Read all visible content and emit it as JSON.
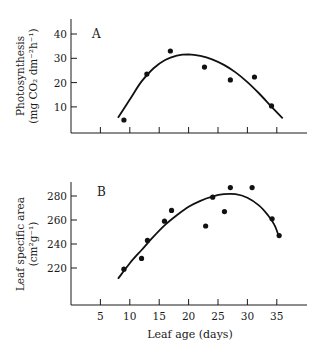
{
  "chart_data": [
    {
      "panel": "A",
      "type": "scatter",
      "title": "",
      "panel_label": "A",
      "xlabel": "",
      "ylabel": "Photosynthesis",
      "ylabel_units": "(mg CO₂ dm⁻²h⁻¹)",
      "xlim": [
        0,
        40
      ],
      "ylim": [
        0,
        45
      ],
      "x_ticks": [
        5,
        10,
        15,
        20,
        25,
        30,
        35
      ],
      "x_tick_labels_shown": false,
      "y_ticks": [
        10,
        20,
        30,
        40
      ],
      "y_tick_labels": [
        "10",
        "20",
        "30",
        "40"
      ],
      "grid": false,
      "points": [
        {
          "x": 9,
          "y": 4.6
        },
        {
          "x": 12.9,
          "y": 23.5
        },
        {
          "x": 16.9,
          "y": 33
        },
        {
          "x": 22.7,
          "y": 26.4
        },
        {
          "x": 27.1,
          "y": 21.1
        },
        {
          "x": 31.2,
          "y": 22.3
        },
        {
          "x": 34.1,
          "y": 10.4
        }
      ],
      "fitted_curve": [
        {
          "x": 8,
          "y": 5.5
        },
        {
          "x": 10,
          "y": 13
        },
        {
          "x": 12,
          "y": 20.5
        },
        {
          "x": 14,
          "y": 25.8
        },
        {
          "x": 16,
          "y": 29.3
        },
        {
          "x": 18,
          "y": 31.1
        },
        {
          "x": 20,
          "y": 31.6
        },
        {
          "x": 22,
          "y": 31.0
        },
        {
          "x": 24,
          "y": 29.6
        },
        {
          "x": 26,
          "y": 27.3
        },
        {
          "x": 28,
          "y": 24.2
        },
        {
          "x": 30,
          "y": 20.2
        },
        {
          "x": 32,
          "y": 15.5
        },
        {
          "x": 34,
          "y": 10.3
        },
        {
          "x": 36,
          "y": 5.3
        }
      ]
    },
    {
      "panel": "B",
      "type": "scatter",
      "title": "",
      "panel_label": "B",
      "xlabel": "Leaf age (days)",
      "ylabel": "Leaf specific area",
      "ylabel_units": "(cm²g⁻¹)",
      "xlim": [
        0,
        40
      ],
      "ylim": [
        170,
        292
      ],
      "x_ticks": [
        5,
        10,
        15,
        20,
        25,
        30,
        35
      ],
      "x_tick_labels": [
        "5",
        "10",
        "15",
        "20",
        "25",
        "30",
        "35"
      ],
      "y_ticks": [
        220,
        240,
        260,
        280
      ],
      "y_tick_labels": [
        "220",
        "240",
        "260",
        "280"
      ],
      "grid": false,
      "points": [
        {
          "x": 9,
          "y": 219
        },
        {
          "x": 12,
          "y": 228
        },
        {
          "x": 13,
          "y": 243
        },
        {
          "x": 15.9,
          "y": 259
        },
        {
          "x": 17.1,
          "y": 268
        },
        {
          "x": 22.9,
          "y": 255
        },
        {
          "x": 24.1,
          "y": 279
        },
        {
          "x": 26.1,
          "y": 267
        },
        {
          "x": 27.1,
          "y": 287
        },
        {
          "x": 30.8,
          "y": 287
        },
        {
          "x": 34.2,
          "y": 261
        },
        {
          "x": 35.4,
          "y": 247
        }
      ],
      "fitted_curve": [
        {
          "x": 8,
          "y": 211
        },
        {
          "x": 10,
          "y": 224
        },
        {
          "x": 12,
          "y": 235
        },
        {
          "x": 14,
          "y": 246
        },
        {
          "x": 16,
          "y": 256
        },
        {
          "x": 18,
          "y": 264
        },
        {
          "x": 20,
          "y": 271
        },
        {
          "x": 22,
          "y": 276
        },
        {
          "x": 24,
          "y": 279.5
        },
        {
          "x": 26,
          "y": 281.5
        },
        {
          "x": 28,
          "y": 281.5
        },
        {
          "x": 30,
          "y": 278.5
        },
        {
          "x": 32,
          "y": 272
        },
        {
          "x": 33.5,
          "y": 264
        },
        {
          "x": 34.6,
          "y": 256
        },
        {
          "x": 35.3,
          "y": 247
        }
      ]
    }
  ],
  "figure": {
    "panel_a_label": "A",
    "panel_b_label": "B",
    "panel_a_ylabel": "Photosynthesis",
    "panel_a_yunits": "(mg CO₂ dm⁻²h⁻¹)",
    "panel_b_ylabel": "Leaf specific area",
    "panel_b_yunits": "(cm²g⁻¹)",
    "xlabel": "Leaf age (days)"
  }
}
